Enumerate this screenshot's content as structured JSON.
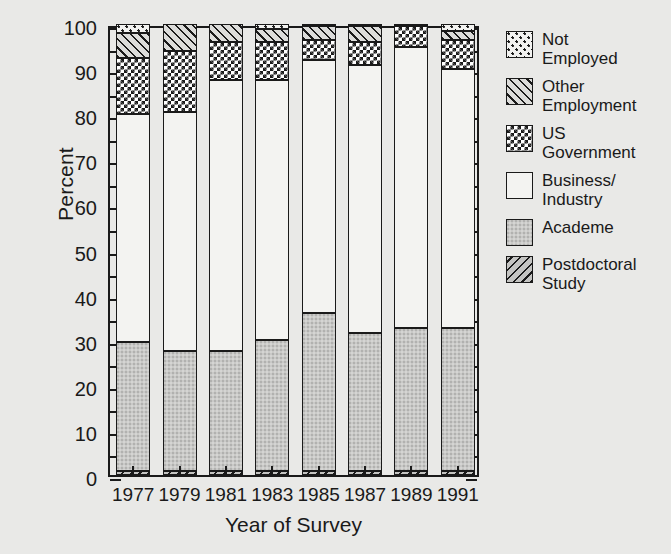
{
  "chart_data": {
    "type": "bar",
    "variant": "stacked-percent",
    "title": "",
    "subtitle": "",
    "xlabel": "Year of Survey",
    "ylabel": "Percent",
    "categories": [
      "1977",
      "1979",
      "1981",
      "1983",
      "1985",
      "1987",
      "1989",
      "1991"
    ],
    "ylim": [
      0,
      100
    ],
    "ytick_step": 10,
    "yminor_tick_step": 5,
    "ytick_labels": [
      "0",
      "10",
      "20",
      "30",
      "40",
      "50",
      "60",
      "70",
      "80",
      "90",
      "100"
    ],
    "grid": false,
    "legend_position": "right",
    "stack_order_bottom_to_top": [
      "Postdoctoral Study",
      "Academe",
      "Business/Industry",
      "US Government",
      "Other Employment",
      "Not Employed"
    ],
    "series": [
      {
        "name": "Postdoctoral Study",
        "values": [
          1.0,
          1.0,
          1.0,
          1.0,
          1.0,
          1.0,
          1.0,
          1.0
        ]
      },
      {
        "name": "Academe",
        "values": [
          28.5,
          26.5,
          26.5,
          29.0,
          35.0,
          30.5,
          31.5,
          31.5
        ]
      },
      {
        "name": "Business/Industry",
        "values": [
          50.5,
          53.0,
          60.0,
          57.5,
          56.0,
          59.5,
          62.5,
          57.5
        ]
      },
      {
        "name": "US Government",
        "values": [
          12.5,
          13.5,
          8.5,
          8.5,
          4.5,
          5.0,
          4.5,
          6.5
        ]
      },
      {
        "name": "Other Employment",
        "values": [
          5.5,
          6.0,
          4.0,
          3.0,
          3.0,
          3.5,
          0.5,
          2.0
        ]
      },
      {
        "name": "Not Employed",
        "values": [
          2.0,
          0.0,
          0.0,
          1.0,
          0.5,
          0.5,
          0.0,
          1.5
        ]
      }
    ]
  },
  "legend": {
    "items": [
      {
        "label": "Not\nEmployed",
        "pattern": "dots",
        "swatch_name": "legend-swatch-not-employed"
      },
      {
        "label": "Other\nEmployment",
        "pattern": "fhatch",
        "swatch_name": "legend-swatch-other-employment"
      },
      {
        "label": "US\nGovernment",
        "pattern": "check",
        "swatch_name": "legend-swatch-us-government"
      },
      {
        "label": "Business/\nIndustry",
        "pattern": "white",
        "swatch_name": "legend-swatch-business-industry"
      },
      {
        "label": "Academe",
        "pattern": "gray",
        "swatch_name": "legend-swatch-academe"
      },
      {
        "label": "Postdoctoral\nStudy",
        "pattern": "bhatch",
        "swatch_name": "legend-swatch-postdoctoral-study"
      }
    ]
  },
  "colors": {
    "background": "#e9e9e7",
    "axis": "#1a1a1a",
    "text": "#1a1a1a",
    "business_industry": "#f3f3f1",
    "academe": "#c9c9c7"
  }
}
